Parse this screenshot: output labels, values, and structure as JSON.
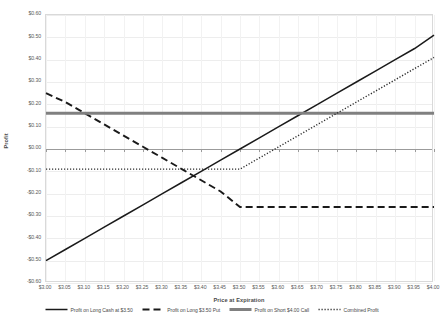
{
  "chart_data": {
    "type": "line",
    "title": "",
    "xlabel": "Price at Expiration",
    "ylabel": "Profit",
    "xlim": [
      3.0,
      4.0
    ],
    "ylim": [
      -0.6,
      0.6
    ],
    "grid": true,
    "legend_position": "bottom",
    "x_tick_labels": [
      "$3.00",
      "$3.05",
      "$3.10",
      "$3.15",
      "$3.20",
      "$3.25",
      "$3.30",
      "$3.35",
      "$3.40",
      "$3.45",
      "$3.50",
      "$3.55",
      "$3.60",
      "$3.65",
      "$3.70",
      "$3.75",
      "$3.80",
      "$3.85",
      "$3.90",
      "$3.95",
      "$4.00"
    ],
    "y_tick_labels": [
      "$0.60",
      "$0.50",
      "$0.40",
      "$0.30",
      "$0.20",
      "$0.10",
      "$0.00",
      "-$0.10",
      "-$0.20",
      "-$0.30",
      "-$0.40",
      "-$0.50",
      "-$0.60"
    ],
    "x": [
      3.0,
      3.05,
      3.1,
      3.15,
      3.2,
      3.25,
      3.3,
      3.35,
      3.4,
      3.45,
      3.5,
      3.55,
      3.6,
      3.65,
      3.7,
      3.75,
      3.8,
      3.85,
      3.9,
      3.95,
      4.0
    ],
    "series": [
      {
        "name": "Profit on Long Cash at $3.50",
        "style": "solid",
        "color": "#1a1a1a",
        "values": [
          -0.5,
          -0.45,
          -0.4,
          -0.35,
          -0.3,
          -0.25,
          -0.2,
          -0.15,
          -0.1,
          -0.05,
          0.0,
          0.05,
          0.1,
          0.15,
          0.2,
          0.25,
          0.3,
          0.35,
          0.4,
          0.45,
          0.51
        ]
      },
      {
        "name": "Profit on Long $3.50 Put",
        "style": "dashed",
        "color": "#1a1a1a",
        "values": [
          0.25,
          0.21,
          0.16,
          0.11,
          0.06,
          0.01,
          -0.04,
          -0.09,
          -0.14,
          -0.19,
          -0.26,
          -0.26,
          -0.26,
          -0.26,
          -0.26,
          -0.26,
          -0.26,
          -0.26,
          -0.26,
          -0.26,
          -0.26
        ]
      },
      {
        "name": "Profit on Short $4.00 Call",
        "style": "thick-solid-gray",
        "color": "#808080",
        "values": [
          0.16,
          0.16,
          0.16,
          0.16,
          0.16,
          0.16,
          0.16,
          0.16,
          0.16,
          0.16,
          0.16,
          0.16,
          0.16,
          0.16,
          0.16,
          0.16,
          0.16,
          0.16,
          0.16,
          0.16,
          0.16
        ]
      },
      {
        "name": "Combined Profit",
        "style": "dotted",
        "color": "#2b2b2b",
        "values": [
          -0.09,
          -0.09,
          -0.09,
          -0.09,
          -0.09,
          -0.09,
          -0.09,
          -0.09,
          -0.09,
          -0.09,
          -0.09,
          -0.04,
          0.01,
          0.06,
          0.11,
          0.16,
          0.21,
          0.26,
          0.31,
          0.36,
          0.41
        ]
      }
    ]
  },
  "legend": {
    "items": [
      {
        "label": "Profit on Long Cash at $3.50"
      },
      {
        "label": "Profit on Long $3.50 Put"
      },
      {
        "label": "Profit on Short $4.00 Call"
      },
      {
        "label": "Combined Profit"
      }
    ]
  }
}
